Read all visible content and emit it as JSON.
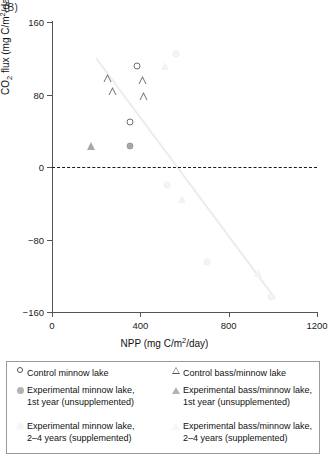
{
  "panel": {
    "label": "(B)"
  },
  "chart_data": {
    "type": "scatter",
    "title": "",
    "xlabel": "NPP (mg C/m2/day)",
    "ylabel": "CO2 flux (mg C/m2/day)",
    "xlabel_parts": {
      "pre": "NPP (mg C/m",
      "sup": "2",
      "post": "/day)"
    },
    "ylabel_parts": {
      "pre": "CO",
      "sub": "2",
      "mid": " flux (mg C/m",
      "sup": "2",
      "post": "/day)"
    },
    "xlim": [
      0,
      1200
    ],
    "ylim": [
      -160,
      160
    ],
    "xticks": [
      0,
      400,
      800,
      1200
    ],
    "yticks": [
      160,
      80,
      0,
      -80,
      -160
    ],
    "xtick_labels": [
      "0",
      "400",
      "800",
      "1200"
    ],
    "ytick_labels": [
      "160",
      "80",
      "0",
      "−80",
      "−160"
    ],
    "grid": false,
    "zero_line": {
      "value": 0,
      "style": "dashed",
      "color": "#1a1a1a"
    },
    "trend_line": {
      "x_start": 200,
      "y_start": 120,
      "x_end": 1010,
      "y_end": -145,
      "color": "#ececec"
    },
    "legend_position": "below-plot",
    "series": [
      {
        "name": "Control minnow lake",
        "marker": "circle-open",
        "color": "#6f6f6f",
        "points": [
          {
            "x": 385,
            "y": 112
          },
          {
            "x": 352,
            "y": 50
          }
        ]
      },
      {
        "name": "Control bass/minnow lake",
        "marker": "triangle-open",
        "color": "#6f6f6f",
        "points": [
          {
            "x": 253,
            "y": 98
          },
          {
            "x": 278,
            "y": 93
          },
          {
            "x": 418,
            "y": 96
          },
          {
            "x": 410,
            "y": 122
          }
        ]
      },
      {
        "name": "Experimental minnow lake, 1st year (unsupplemented)",
        "marker": "circle-filled",
        "color": "#a8a8a8",
        "points": [
          {
            "x": 352,
            "y": 23
          }
        ]
      },
      {
        "name": "Experimental bass/minnow lake, 1st year (unsupplemented)",
        "marker": "triangle-filled",
        "color": "#a8a8a8",
        "points": [
          {
            "x": 178,
            "y": 23
          }
        ]
      },
      {
        "name": "Experimental minnow lake, 2–4 years (supplemented)",
        "marker": "circle-faint",
        "color": "#f2f2f2",
        "points": [
          {
            "x": 560,
            "y": 125
          },
          {
            "x": 520,
            "y": -20
          },
          {
            "x": 700,
            "y": -105
          },
          {
            "x": 990,
            "y": -143
          }
        ]
      },
      {
        "name": "Experimental bass/minnow lake, 2–4 years (supplemented)",
        "marker": "triangle-faint",
        "color": "#f2f2f2",
        "points": [
          {
            "x": 512,
            "y": 112
          },
          {
            "x": 590,
            "y": -35
          },
          {
            "x": 935,
            "y": -117
          }
        ]
      }
    ]
  },
  "legend": {
    "rows": [
      {
        "left": {
          "marker": "circle-open",
          "label": "Control minnow lake"
        },
        "right": {
          "marker": "triangle-open",
          "label": "Control bass/minnow lake"
        }
      },
      {
        "left": {
          "marker": "circle-filled",
          "line1": "Experimental minnow lake,",
          "line2": "1st year (unsupplemented)"
        },
        "right": {
          "marker": "triangle-filled",
          "line1": "Experimental bass/minnow lake,",
          "line2": "1st year (unsupplemented)"
        }
      },
      {
        "left": {
          "marker": "circle-faint",
          "line1": "Experimental minnow lake,",
          "line2": "2–4 years (supplemented)"
        },
        "right": {
          "marker": "triangle-faint",
          "line1": "Experimental bass/minnow lake,",
          "line2": "2–4 years (supplemented)"
        }
      }
    ]
  }
}
